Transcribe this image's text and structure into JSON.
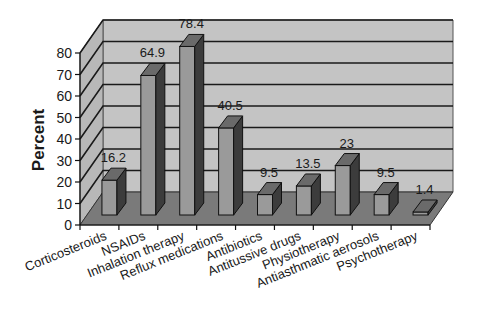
{
  "chart_data": {
    "type": "bar",
    "style": "3d-column",
    "title": "",
    "xlabel": "",
    "ylabel": "Percent",
    "ylim": [
      0,
      80
    ],
    "yticks": [
      0,
      10,
      20,
      30,
      40,
      50,
      60,
      70,
      80
    ],
    "grid": true,
    "legend": null,
    "categories": [
      "Corticosteroids",
      "NSAIDs",
      "Inhalation therapy",
      "Reflux medications",
      "Antibiotics",
      "Antitussive drugs",
      "Physiotherapy",
      "Antiasthmatic aerosols",
      "Psychotherapy"
    ],
    "values": [
      16.2,
      64.9,
      78.4,
      40.5,
      9.5,
      13.5,
      23,
      9.5,
      1.4
    ],
    "data_labels": [
      "16.2",
      "64.9",
      "78.4",
      "40.5",
      "9.5",
      "13.5",
      "23",
      "9.5",
      "1.4"
    ]
  },
  "colors": {
    "wall": "#c4c4c4",
    "side_wall": "#b8b8b8",
    "floor": "#7a7a7a",
    "bar_front": "#9a9a9a",
    "bar_top": "#6a6a6a",
    "bar_side": "#3c3c3c",
    "grid": "#1a1a1a"
  }
}
